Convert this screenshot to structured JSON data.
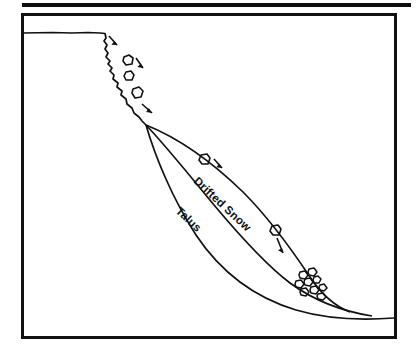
{
  "figure": {
    "background_color": "#ffffff",
    "ink_color": "#111111",
    "scan_artifact": {
      "name": "top-black-bar",
      "color": "#0d0d0d"
    },
    "frame": {
      "name": "figure-border",
      "stroke_color": "#111111",
      "x": 22,
      "y": 14,
      "width": 374,
      "height": 324
    },
    "labels": [
      {
        "id": "drifted-snow",
        "text": "Drifted Snow",
        "rotation_degrees": 43,
        "x": 193,
        "y": 182,
        "font_size": 11
      },
      {
        "id": "talus",
        "text": "Talus",
        "rotation_degrees": 43,
        "x": 175,
        "y": 212,
        "font_size": 11
      }
    ],
    "profile_lines": [
      {
        "id": "cliff-and-plateau",
        "name": "plateau-and-cliff-face",
        "description": "Flat plateau top with jagged rock cliff face dropping to the apex"
      },
      {
        "id": "upper-snow-surface",
        "name": "drifted-snow-surface",
        "description": "Upper concave-convex curve forming the drifted snow surface"
      },
      {
        "id": "middle-contact",
        "name": "snow-talus-contact",
        "description": "Middle curve separating drifted snow from talus"
      },
      {
        "id": "lower-talus-base",
        "name": "talus-base-surface",
        "description": "Lower concave curve forming the talus / bedrock base"
      }
    ],
    "falling_rocks": {
      "name": "falling-rock-clasts",
      "count_on_cliff": 3,
      "count_on_slope": 2,
      "count_in_pile": 9
    },
    "motion_arrows": {
      "name": "rockfall-motion-arrows",
      "count": 4,
      "description": "Short arrows indicating downslope rock movement"
    },
    "rock_pile": {
      "name": "accumulated-rock-pile",
      "description": "Cluster of rounded clasts accumulated at the slope toe"
    }
  }
}
